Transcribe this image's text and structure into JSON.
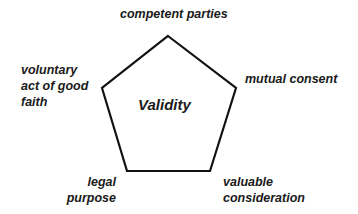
{
  "diagram": {
    "type": "pentagon",
    "center_label": "Validity",
    "stroke_color": "#111111",
    "vertices": [
      {
        "position": "top",
        "label": "competent parties"
      },
      {
        "position": "right",
        "label": "mutual consent"
      },
      {
        "position": "bottom-right",
        "label_lines": [
          "valuable",
          "consideration"
        ]
      },
      {
        "position": "bottom-left",
        "label_lines": [
          "legal",
          "purpose"
        ]
      },
      {
        "position": "left",
        "label_lines": [
          "voluntary",
          "act of good",
          "faith"
        ]
      }
    ]
  }
}
